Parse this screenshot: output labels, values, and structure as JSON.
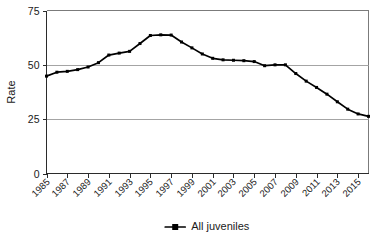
{
  "chart_data": {
    "type": "line",
    "title": "",
    "subtitle": "",
    "xlabel": "",
    "ylabel": "Rate",
    "xlim": [
      1985,
      2016
    ],
    "ylim": [
      0,
      75
    ],
    "yticks": [
      0,
      25,
      50,
      75
    ],
    "ytick_labels": [
      "0",
      "25",
      "50",
      "75"
    ],
    "xticks": [
      1985,
      1987,
      1989,
      1991,
      1993,
      1995,
      1997,
      1999,
      2001,
      2003,
      2005,
      2007,
      2009,
      2011,
      2013,
      2015
    ],
    "xtick_labels": [
      "1985",
      "1987",
      "1989",
      "1991",
      "1993",
      "1995",
      "1997",
      "1999",
      "2001",
      "2003",
      "2005",
      "2007",
      "2009",
      "2011",
      "2013",
      "2015"
    ],
    "grid": "horizontal-major",
    "legend_position": "bottom-center",
    "x": [
      1985,
      1986,
      1987,
      1988,
      1989,
      1990,
      1991,
      1992,
      1993,
      1994,
      1995,
      1996,
      1997,
      1998,
      1999,
      2000,
      2001,
      2002,
      2003,
      2004,
      2005,
      2006,
      2007,
      2008,
      2009,
      2010,
      2011,
      2012,
      2013,
      2014,
      2015,
      2016
    ],
    "series": [
      {
        "name": "All juveniles",
        "marker": "square",
        "color": "#000000",
        "values": [
          44.8,
          46.6,
          47.0,
          47.8,
          49.0,
          51.0,
          54.5,
          55.4,
          56.2,
          59.8,
          63.5,
          63.8,
          63.7,
          60.5,
          57.8,
          55.0,
          53.0,
          52.3,
          52.1,
          51.9,
          51.5,
          49.6,
          50.0,
          50.0,
          46.0,
          42.5,
          39.6,
          36.5,
          33.0,
          29.6,
          27.4,
          26.3
        ]
      }
    ],
    "legend": [
      {
        "label": "All juveniles",
        "color": "#000000",
        "marker": "square"
      }
    ]
  },
  "axis": {
    "y_title": "Rate"
  },
  "colors": {
    "series": "#000000",
    "gridline": "#9a9a9a",
    "axis": "#2b2b2b",
    "background": "#ffffff"
  }
}
